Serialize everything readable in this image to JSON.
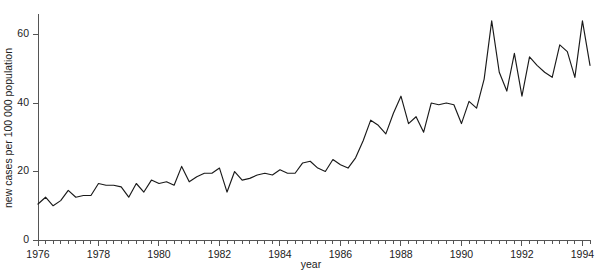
{
  "chart_data": {
    "type": "line",
    "title": "",
    "xlabel": "year",
    "ylabel": "new cases per 100 000 population",
    "xlim": [
      1976,
      1994.25
    ],
    "ylim": [
      0,
      66
    ],
    "grid": false,
    "legend": null,
    "x_tick_labels": [
      "1976",
      "1978",
      "1980",
      "1982",
      "1984",
      "1986",
      "1988",
      "1990",
      "1992",
      "1994"
    ],
    "x_tick_values": [
      1976,
      1978,
      1980,
      1982,
      1984,
      1986,
      1988,
      1990,
      1992,
      1994
    ],
    "x_minor_interval": 0.25,
    "y_tick_labels": [
      "0",
      "20",
      "40",
      "60"
    ],
    "y_tick_values": [
      0,
      20,
      40,
      60
    ],
    "series": [
      {
        "name": "new cases per 100 000 population",
        "color": "#1a1a1a",
        "x": [
          1976.0,
          1976.25,
          1976.5,
          1976.75,
          1977.0,
          1977.25,
          1977.5,
          1977.75,
          1978.0,
          1978.25,
          1978.5,
          1978.75,
          1979.0,
          1979.25,
          1979.5,
          1979.75,
          1980.0,
          1980.25,
          1980.5,
          1980.75,
          1981.0,
          1981.25,
          1981.5,
          1981.75,
          1982.0,
          1982.25,
          1982.5,
          1982.75,
          1983.0,
          1983.25,
          1983.5,
          1983.75,
          1984.0,
          1984.25,
          1984.5,
          1984.75,
          1985.0,
          1985.25,
          1985.5,
          1985.75,
          1986.0,
          1986.25,
          1986.5,
          1986.75,
          1987.0,
          1987.25,
          1987.5,
          1987.75,
          1988.0,
          1988.25,
          1988.5,
          1988.75,
          1989.0,
          1989.25,
          1989.5,
          1989.75,
          1990.0,
          1990.25,
          1990.5,
          1990.75,
          1991.0,
          1991.25,
          1991.5,
          1991.75,
          1992.0,
          1992.25,
          1992.5,
          1992.75,
          1993.0,
          1993.25,
          1993.5,
          1993.75,
          1994.0,
          1994.25
        ],
        "values": [
          10.5,
          12.5,
          10.0,
          11.5,
          14.5,
          12.5,
          13.0,
          13.0,
          16.5,
          16.0,
          16.0,
          15.5,
          12.5,
          16.5,
          14.0,
          17.5,
          16.5,
          17.0,
          16.0,
          21.5,
          17.0,
          18.5,
          19.5,
          19.5,
          21.0,
          14.0,
          20.0,
          17.5,
          18.0,
          19.0,
          19.5,
          19.0,
          20.5,
          19.5,
          19.5,
          22.5,
          23.0,
          21.0,
          20.0,
          23.5,
          22.0,
          21.0,
          24.0,
          29.0,
          35.0,
          33.5,
          31.0,
          37.0,
          42.0,
          34.0,
          36.0,
          31.5,
          40.0,
          39.5,
          40.0,
          39.5,
          34.0,
          40.5,
          38.5,
          47.0,
          64.0,
          49.0,
          43.5,
          54.5,
          42.0,
          53.5,
          51.0,
          49.0,
          47.5,
          57.0,
          55.0,
          47.5,
          64.0,
          51.0
        ]
      }
    ]
  }
}
